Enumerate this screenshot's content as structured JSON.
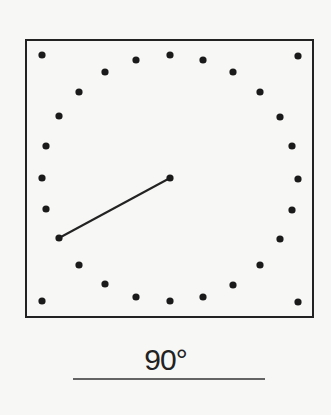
{
  "diagram": {
    "type": "clock-dot-diagram",
    "frame": {
      "x": 26,
      "y": 40,
      "width": 287,
      "height": 277,
      "stroke": "#222222"
    },
    "center": {
      "x": 170,
      "y": 178
    },
    "dots": [
      [
        42,
        55
      ],
      [
        136,
        60
      ],
      [
        170,
        55
      ],
      [
        203,
        60
      ],
      [
        298,
        56
      ],
      [
        105,
        72
      ],
      [
        233,
        72
      ],
      [
        79,
        92
      ],
      [
        260,
        92
      ],
      [
        59,
        116
      ],
      [
        280,
        117
      ],
      [
        46,
        146
      ],
      [
        292,
        146
      ],
      [
        42,
        178
      ],
      [
        298,
        179
      ],
      [
        170,
        178
      ],
      [
        46,
        209
      ],
      [
        292,
        210
      ],
      [
        59,
        238
      ],
      [
        280,
        239
      ],
      [
        79,
        265
      ],
      [
        260,
        265
      ],
      [
        105,
        284
      ],
      [
        233,
        285
      ],
      [
        136,
        297
      ],
      [
        170,
        301
      ],
      [
        203,
        297
      ],
      [
        42,
        301
      ],
      [
        298,
        302
      ]
    ],
    "hand": {
      "from": [
        170,
        178
      ],
      "to": [
        59,
        238
      ]
    },
    "dot_color": "#1a1a1a",
    "angle_label": "90°",
    "answer_line": {
      "x1": 73,
      "x2": 265,
      "y": 379
    }
  }
}
